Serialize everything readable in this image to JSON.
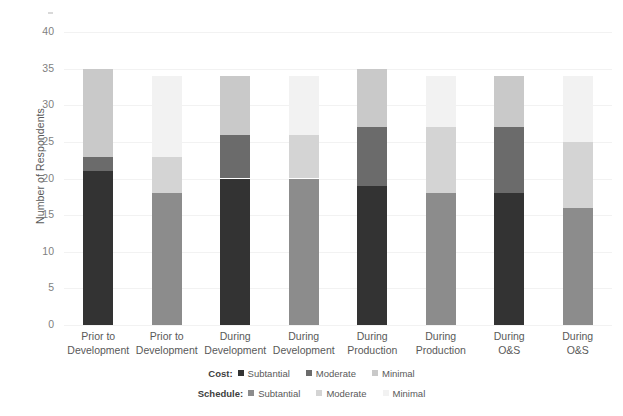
{
  "chart_data": {
    "type": "bar",
    "stacked": true,
    "title": "",
    "xlabel": "",
    "ylabel": "Number of Respondents",
    "ylim": [
      0,
      40
    ],
    "ytick_step": 5,
    "yticks": [
      0,
      5,
      10,
      15,
      20,
      25,
      30,
      35,
      40
    ],
    "grid": true,
    "legend_position": "bottom",
    "categories": [
      "Prior to Development",
      "Prior to Development",
      "During Development",
      "During Development",
      "During Production",
      "During Production",
      "During O&S",
      "During O&S"
    ],
    "category_lines": [
      [
        "Prior to",
        "Development"
      ],
      [
        "Prior to",
        "Development"
      ],
      [
        "During",
        "Development"
      ],
      [
        "During",
        "Development"
      ],
      [
        "During",
        "Production"
      ],
      [
        "During",
        "Production"
      ],
      [
        "During",
        "O&S"
      ],
      [
        "During",
        "O&S"
      ]
    ],
    "bar_groups": [
      "Cost",
      "Schedule",
      "Cost",
      "Schedule",
      "Cost",
      "Schedule",
      "Cost",
      "Schedule"
    ],
    "series": [
      {
        "name": "Substantial",
        "values": [
          21,
          18,
          20,
          20,
          19,
          18,
          18,
          16
        ]
      },
      {
        "name": "Moderate",
        "values": [
          2,
          5,
          6,
          6,
          8,
          9,
          9,
          9
        ]
      },
      {
        "name": "Minimal",
        "values": [
          12,
          11,
          8,
          8,
          8,
          7,
          7,
          9
        ]
      }
    ],
    "bar_totals": [
      35,
      34,
      34,
      34,
      35,
      34,
      34,
      34
    ],
    "colors": {
      "cost_substantial": "#333333",
      "cost_moderate": "#6b6b6b",
      "cost_minimal": "#c9c9c9",
      "schedule_substantial": "#8c8c8c",
      "schedule_moderate": "#d4d4d4",
      "schedule_minimal": "#f2f2f2",
      "gridline": "#f2f2f2",
      "axis_text": "#7f7f7f",
      "label_text": "#595959"
    }
  },
  "legend": {
    "rows": [
      {
        "title": "Cost:",
        "entries": [
          {
            "label": "Subtantial",
            "color": "#333333"
          },
          {
            "label": "Moderate",
            "color": "#6b6b6b"
          },
          {
            "label": "Minimal",
            "color": "#c9c9c9"
          }
        ]
      },
      {
        "title": "Schedule:",
        "entries": [
          {
            "label": "Subtantial",
            "color": "#8c8c8c"
          },
          {
            "label": "Moderate",
            "color": "#d4d4d4"
          },
          {
            "label": "Minimal",
            "color": "#f2f2f2"
          }
        ]
      }
    ]
  }
}
